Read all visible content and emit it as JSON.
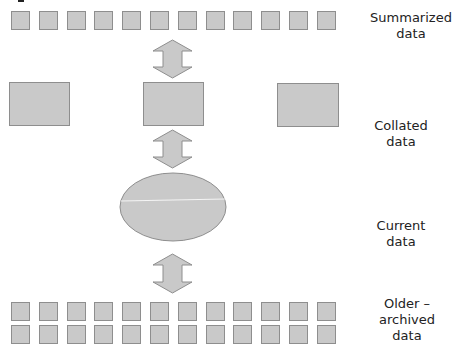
{
  "diagram": {
    "layers": [
      {
        "id": "summarized",
        "label_line1": "Summarized",
        "label_line2": "data",
        "shape": "small-squares",
        "count": 12,
        "rows": 1
      },
      {
        "id": "collated",
        "label_line1": "Collated",
        "label_line2": "data",
        "shape": "rectangles",
        "count": 3
      },
      {
        "id": "current",
        "label_line1": "Current",
        "label_line2": "data",
        "shape": "ellipse"
      },
      {
        "id": "archived",
        "label_line1": "Older –",
        "label_line2": "archived",
        "label_line3": "data",
        "shape": "small-squares",
        "count": 24,
        "rows": 2
      }
    ],
    "arrows": [
      {
        "from": "summarized",
        "to": "collated",
        "type": "bidirectional"
      },
      {
        "from": "collated",
        "to": "current",
        "type": "bidirectional"
      },
      {
        "from": "current",
        "to": "archived",
        "type": "bidirectional"
      }
    ],
    "colors": {
      "fill": "#c9c9c9",
      "stroke": "#8e8e8e",
      "text": "#222222"
    }
  }
}
